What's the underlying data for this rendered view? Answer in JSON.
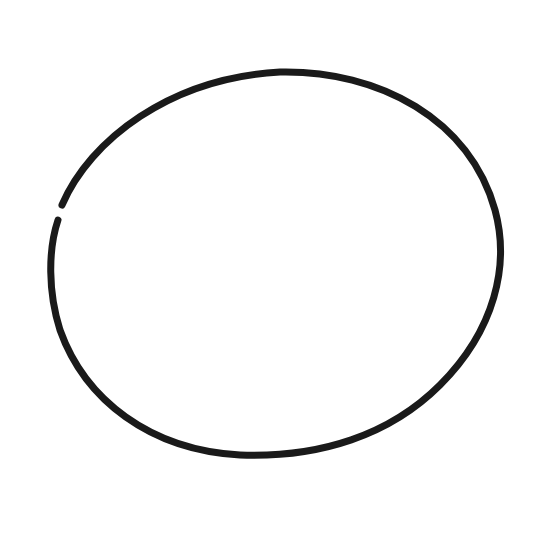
{
  "drawing": {
    "background": "#ffffff",
    "stroke_color": "#1a1a1a",
    "stroke_width": 7,
    "shape": "hand-drawn-oval",
    "oval": {
      "center_x": 275,
      "center_y": 263,
      "radius_x": 226,
      "radius_y": 192,
      "gap_at": {
        "x": 62,
        "y": 210
      }
    }
  }
}
